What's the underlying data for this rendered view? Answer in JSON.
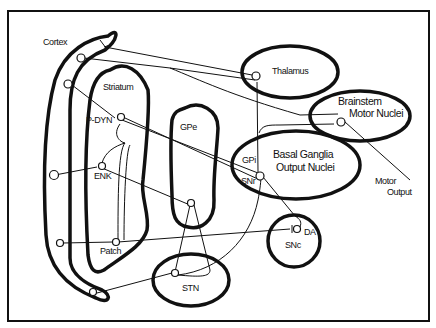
{
  "diagram": {
    "regions": {
      "cortex": "Cortex",
      "striatum": "Striatum",
      "gpe": "GPe",
      "thalamus": "Thalamus",
      "brainstem_line1": "Brainstem",
      "brainstem_line2": "Motor Nuclei",
      "bg_output_line1": "Basal Ganglia",
      "bg_output_line2": "Output Nuclei",
      "gpi": "GPi",
      "snr": "SNr",
      "snc": "SNc",
      "stn": "STN"
    },
    "neurons": {
      "p_dyn": "P-DYN",
      "enk": "ENK",
      "patch": "Patch",
      "da": "DA"
    },
    "output": {
      "line1": "Motor",
      "line2": "Output"
    },
    "stroke_color": "#111111",
    "background_color": "#ffffff"
  }
}
